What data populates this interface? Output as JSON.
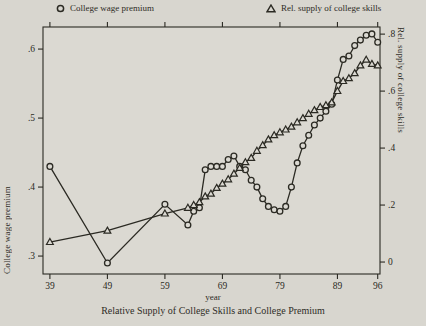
{
  "page": {
    "background": "#d8d6cf",
    "ink": "#2b2a23"
  },
  "legend": [
    {
      "icon": "circle-marker",
      "label": "College wage premium"
    },
    {
      "icon": "triangle-marker",
      "label": "Rel. supply of college skills"
    }
  ],
  "chart_data": {
    "type": "line",
    "title": "Relative Supply of College Skills and College Premium",
    "xlabel": "year",
    "ylabel_left": "College wage premium",
    "ylabel_right": "Rel. supply of college skills",
    "grid": false,
    "legend_position": "top",
    "x_range": [
      37.8,
      96.4
    ],
    "left_range": [
      0.274,
      0.632
    ],
    "right_range": [
      -0.042,
      0.825
    ],
    "x_ticks": [
      {
        "v": 39,
        "label": "39"
      },
      {
        "v": 49,
        "label": "49"
      },
      {
        "v": 59,
        "label": "59"
      },
      {
        "v": 69,
        "label": "69"
      },
      {
        "v": 79,
        "label": "79"
      },
      {
        "v": 89,
        "label": "89"
      },
      {
        "v": 96,
        "label": "96"
      }
    ],
    "left_ticks": [
      {
        "v": 0.3,
        "label": ".3"
      },
      {
        "v": 0.4,
        "label": ".4"
      },
      {
        "v": 0.5,
        "label": ".5"
      },
      {
        "v": 0.6,
        "label": ".6"
      }
    ],
    "right_ticks": [
      {
        "v": 0.0,
        "label": "0"
      },
      {
        "v": 0.2,
        "label": ".2"
      },
      {
        "v": 0.4,
        "label": ".4"
      },
      {
        "v": 0.6,
        "label": ".6"
      },
      {
        "v": 0.8,
        "label": ".8"
      }
    ],
    "x": [
      39,
      49,
      59,
      63,
      64,
      65,
      66,
      67,
      68,
      69,
      70,
      71,
      72,
      73,
      74,
      75,
      76,
      77,
      78,
      79,
      80,
      81,
      82,
      83,
      84,
      85,
      86,
      87,
      88,
      89,
      90,
      91,
      92,
      93,
      94,
      95,
      96
    ],
    "series": [
      {
        "name": "College wage premium",
        "axis": "left",
        "marker": "circle",
        "values": [
          0.43,
          0.29,
          0.375,
          0.345,
          0.365,
          0.37,
          0.425,
          0.43,
          0.43,
          0.43,
          0.44,
          0.445,
          0.43,
          0.425,
          0.41,
          0.4,
          0.383,
          0.372,
          0.367,
          0.365,
          0.372,
          0.4,
          0.435,
          0.46,
          0.475,
          0.49,
          0.5,
          0.51,
          0.52,
          0.555,
          0.585,
          0.59,
          0.605,
          0.613,
          0.62,
          0.622,
          0.61
        ]
      },
      {
        "name": "Rel. supply of college skills",
        "axis": "right",
        "marker": "triangle",
        "values": [
          0.07,
          0.11,
          0.17,
          0.19,
          0.2,
          0.21,
          0.23,
          0.24,
          0.26,
          0.275,
          0.29,
          0.31,
          0.33,
          0.35,
          0.365,
          0.39,
          0.41,
          0.43,
          0.445,
          0.455,
          0.465,
          0.475,
          0.49,
          0.505,
          0.52,
          0.533,
          0.544,
          0.55,
          0.56,
          0.6,
          0.635,
          0.645,
          0.663,
          0.69,
          0.71,
          0.695,
          0.69
        ]
      }
    ]
  }
}
